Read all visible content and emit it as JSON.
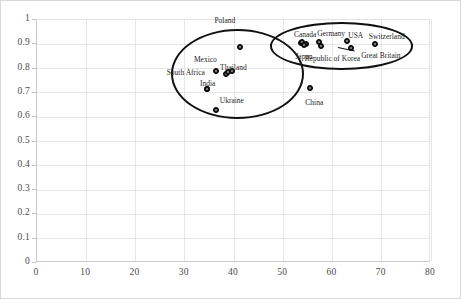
{
  "chart_data": {
    "type": "scatter",
    "title": "",
    "xlabel": "",
    "ylabel": "",
    "xlim": [
      0,
      80
    ],
    "ylim": [
      0,
      1
    ],
    "grid": true,
    "legend": "none",
    "xticks": [
      "0",
      "10",
      "20",
      "30",
      "40",
      "50",
      "60",
      "70",
      "80"
    ],
    "yticks": [
      "0",
      "0.1",
      "0.2",
      "0.3",
      "0.4",
      "0.5",
      "0.6",
      "0.7",
      "0.8",
      "0.9",
      "1"
    ],
    "points": [
      {
        "label": "Poland",
        "x": 41.5,
        "y": 0.885,
        "label_dx": -26,
        "label_dy": -30
      },
      {
        "label": "Mexico",
        "x": 34.5,
        "y": 0.845,
        "label_dx": -12,
        "label_dy": -1,
        "marker": false
      },
      {
        "label": "South Africa",
        "x": 31.0,
        "y": 0.795,
        "label_dx": -22,
        "label_dy": 0,
        "marker": false
      },
      {
        "label": "Thailand",
        "x": 39.0,
        "y": 0.78,
        "label_dx": -8,
        "label_dy": -8
      },
      {
        "label": "India",
        "x": 34.7,
        "y": 0.712,
        "label_dx": -7,
        "label_dy": -9,
        "marker": true
      },
      {
        "label": "Ukraine",
        "x": 36.5,
        "y": 0.625,
        "label_dx": 4,
        "label_dy": -13
      },
      {
        "label": "Canada",
        "x": 54.0,
        "y": 0.905,
        "label_dx": -8,
        "label_dy": -11
      },
      {
        "label": "Germany",
        "x": 57.5,
        "y": 0.905,
        "label_dx": -2,
        "label_dy": -12
      },
      {
        "label": "Japan",
        "x": 54.5,
        "y": 0.895,
        "label_dx": -9,
        "label_dy": 8
      },
      {
        "label": "Republic of Korea",
        "x": 57.8,
        "y": 0.888,
        "label_dx": -16,
        "label_dy": 9
      },
      {
        "label": "USA",
        "x": 63.2,
        "y": 0.908,
        "label_dx": 1,
        "label_dy": -9
      },
      {
        "label": "Great Britain",
        "x": 64.0,
        "y": 0.882,
        "label_dx": 10,
        "label_dy": 4
      },
      {
        "label": "Switzerland",
        "x": 68.8,
        "y": 0.898,
        "label_dx": -6,
        "label_dy": -11
      },
      {
        "label": "China",
        "x": 55.7,
        "y": 0.716,
        "label_dx": -5,
        "label_dy": 11
      }
    ],
    "extra_markers": [
      {
        "x": 36.5,
        "y": 0.788
      },
      {
        "x": 38.5,
        "y": 0.772
      },
      {
        "x": 39.8,
        "y": 0.784
      },
      {
        "x": 34.7,
        "y": 0.712
      },
      {
        "x": 53.8,
        "y": 0.9
      },
      {
        "x": 54.9,
        "y": 0.896
      }
    ],
    "clusters": [
      {
        "name": "emerging-economies-cluster",
        "cx": 41.0,
        "cy": 0.775,
        "rx": 13.5,
        "ry": 0.185
      },
      {
        "name": "developed-economies-cluster",
        "cx": 62.0,
        "cy": 0.888,
        "rx": 14.5,
        "ry": 0.098
      }
    ],
    "annotations": [
      {
        "name": "usa-leader-line",
        "x1": 61.3,
        "y1": 0.886,
        "x2": 64.6,
        "y2": 0.872
      }
    ]
  }
}
